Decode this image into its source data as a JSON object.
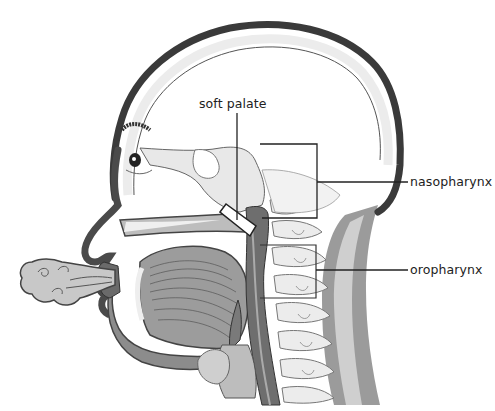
{
  "diagram": {
    "labels": {
      "soft_palate": "soft palate",
      "nasopharynx": "nasopharynx",
      "oropharynx": "oropharynx"
    },
    "colors": {
      "outline": "#3a3a3a",
      "skull_fill": "#ececec",
      "tissue_dark": "#6e6e6e",
      "tissue_mid": "#9a9a9a",
      "tissue_light": "#c4c4c4",
      "bone_light": "#e2e2e2",
      "leader_line": "#222222",
      "background": "#ffffff"
    }
  }
}
